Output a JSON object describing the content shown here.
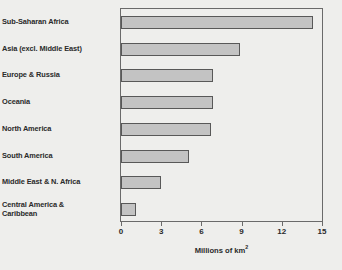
{
  "chart_data": {
    "type": "bar",
    "orientation": "horizontal",
    "title": "",
    "xlabel": "Millions of km2",
    "xlabel_display": "Millions of km",
    "xlabel_superscript": "2",
    "ylabel": "",
    "categories": [
      "Sub-Saharan Africa",
      "Asia (excl. Middle East)",
      "Europe & Russia",
      "Oceania",
      "North America",
      "South America",
      "Middle East & N. Africa",
      "Central America & Caribbean"
    ],
    "category_lines": [
      [
        "Sub-Saharan Africa"
      ],
      [
        "Asia (excl. Middle East)"
      ],
      [
        "Europe & Russia"
      ],
      [
        "Oceania"
      ],
      [
        "North America"
      ],
      [
        "South America"
      ],
      [
        "Middle East & N. Africa"
      ],
      [
        "Central America &",
        "Caribbean"
      ]
    ],
    "values": [
      14.3,
      8.9,
      6.9,
      6.9,
      6.7,
      5.1,
      2.95,
      1.1
    ],
    "xlim": [
      0,
      15
    ],
    "xticks": [
      0,
      3,
      6,
      9,
      12,
      15
    ],
    "xtick_labels": [
      "0",
      "3",
      "6",
      "9",
      "12",
      "15"
    ],
    "grid": false,
    "legend": null,
    "bar_color": "#c3c3c3",
    "bar_border_color": "#585858",
    "frame_color": "#6a6a6a",
    "background_color": "#eeeeec",
    "text_color": "#2a2a2a"
  }
}
